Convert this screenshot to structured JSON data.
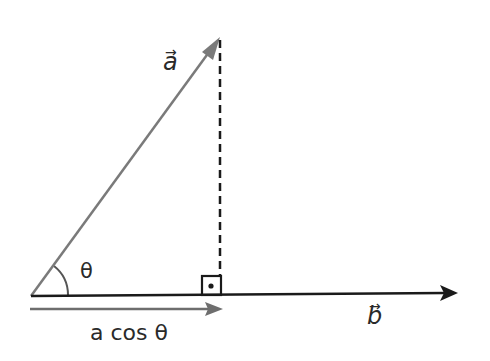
{
  "diagram": {
    "labels": {
      "vector_a": "a",
      "vector_b": "b",
      "angle": "θ",
      "projection": "a cos θ",
      "vector_arrow": "→"
    },
    "colors": {
      "vector_a": "#7a7a7a",
      "vector_b": "#1a1a1a",
      "projection": "#6e6e6e",
      "dashed": "#1a1a1a",
      "text": "#2a2a2a"
    },
    "elements": {
      "origin": [
        31,
        296
      ],
      "vector_a_tip": [
        219,
        38
      ],
      "vector_b_tip": [
        457,
        293
      ],
      "projection_tip": [
        222,
        309
      ],
      "right_angle_box": [
        201,
        275,
        20,
        20
      ]
    }
  }
}
